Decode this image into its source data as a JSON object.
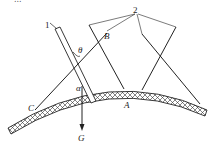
{
  "figure": {
    "caption_fragment": "...",
    "labels": {
      "part1": "1",
      "part2": "2",
      "point_A": "A",
      "point_B": "B",
      "point_C": "C",
      "angle_theta": "θ",
      "angle_alpha": "α",
      "gravity": "G"
    }
  }
}
